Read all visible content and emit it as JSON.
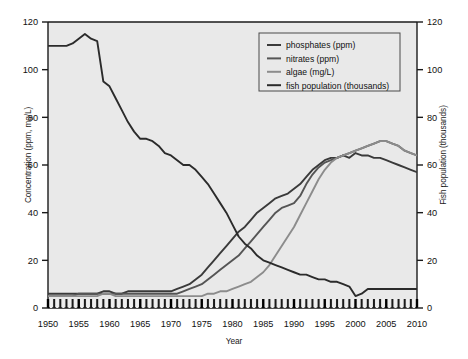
{
  "chart_data": {
    "type": "line",
    "title": "",
    "xlabel": "Year",
    "ylabel": "Concentration (ppm, mg/L)",
    "ylabel_right": "Fish population (thousands)",
    "xlim": [
      1950,
      2010
    ],
    "ylim": [
      0,
      120
    ],
    "ylim_right": [
      0,
      120
    ],
    "xticks": [
      1950,
      1955,
      1960,
      1965,
      1970,
      1975,
      1980,
      1985,
      1990,
      1995,
      2000,
      2005,
      2010
    ],
    "yticks": [
      0,
      20,
      40,
      60,
      80,
      100,
      120
    ],
    "yticks_right": [
      0,
      20,
      40,
      60,
      80,
      100,
      120
    ],
    "minor_tick_interval": 1,
    "grid": false,
    "legend_position": "top-right",
    "x": [
      1950,
      1951,
      1952,
      1953,
      1954,
      1955,
      1956,
      1957,
      1958,
      1959,
      1960,
      1961,
      1962,
      1963,
      1964,
      1965,
      1966,
      1967,
      1968,
      1969,
      1970,
      1971,
      1972,
      1973,
      1974,
      1975,
      1976,
      1977,
      1978,
      1979,
      1980,
      1981,
      1982,
      1983,
      1984,
      1985,
      1986,
      1987,
      1988,
      1989,
      1990,
      1991,
      1992,
      1993,
      1994,
      1995,
      1996,
      1997,
      1998,
      1999,
      2000,
      2001,
      2002,
      2003,
      2004,
      2005,
      2006,
      2007,
      2008,
      2009,
      2010
    ],
    "series": [
      {
        "name": "phosphates (ppm)",
        "unit": "ppm",
        "axis": "left",
        "color": "#3a3a3a",
        "values": [
          6,
          6,
          6,
          6,
          6,
          6,
          6,
          6,
          6,
          7,
          7,
          6,
          6,
          7,
          7,
          7,
          7,
          7,
          7,
          7,
          7,
          8,
          9,
          10,
          12,
          14,
          17,
          20,
          23,
          26,
          29,
          32,
          34,
          37,
          40,
          42,
          44,
          46,
          47,
          48,
          50,
          52,
          55,
          58,
          60,
          62,
          63,
          63,
          64,
          63,
          65,
          64,
          64,
          63,
          63,
          62,
          61,
          60,
          59,
          58,
          57
        ]
      },
      {
        "name": "nitrates (ppm)",
        "unit": "ppm",
        "axis": "left",
        "color": "#555555",
        "values": [
          5,
          5,
          5,
          5,
          5,
          6,
          6,
          6,
          6,
          6,
          6,
          6,
          6,
          6,
          6,
          6,
          6,
          6,
          6,
          6,
          6,
          6,
          7,
          8,
          9,
          10,
          12,
          14,
          16,
          18,
          20,
          22,
          25,
          28,
          31,
          34,
          37,
          40,
          42,
          43,
          44,
          47,
          52,
          56,
          59,
          61,
          62,
          63,
          64,
          65,
          66,
          67,
          68,
          69,
          70,
          70,
          69,
          68,
          66,
          65,
          64
        ]
      },
      {
        "name": "algae (mg/L)",
        "unit": "mg/L",
        "axis": "left",
        "color": "#8c8c8c",
        "values": [
          5,
          5,
          5,
          5,
          5,
          5,
          5,
          5,
          5,
          6,
          6,
          5,
          5,
          5,
          5,
          5,
          5,
          5,
          5,
          5,
          5,
          5,
          5,
          5,
          5,
          5,
          6,
          6,
          7,
          7,
          8,
          9,
          10,
          11,
          13,
          15,
          18,
          22,
          26,
          30,
          34,
          39,
          44,
          49,
          54,
          58,
          61,
          63,
          64,
          65,
          66,
          67,
          68,
          69,
          70,
          70,
          69,
          68,
          66,
          65,
          64
        ]
      },
      {
        "name": "fish population (thousands)",
        "unit": "thousands",
        "axis": "right",
        "color": "#2b2b2b",
        "values": [
          110,
          110,
          110,
          110,
          111,
          113,
          115,
          113,
          112,
          95,
          93,
          88,
          83,
          78,
          74,
          71,
          71,
          70,
          68,
          65,
          64,
          62,
          60,
          60,
          58,
          55,
          52,
          48,
          44,
          40,
          35,
          30,
          27,
          25,
          22,
          20,
          19,
          18,
          17,
          16,
          15,
          14,
          14,
          13,
          12,
          12,
          11,
          11,
          10,
          9,
          5,
          6,
          8,
          8,
          8,
          8,
          8,
          8,
          8,
          8,
          8
        ]
      }
    ],
    "legend": [
      {
        "label": "phosphates (ppm)",
        "color": "#3a3a3a"
      },
      {
        "label": "nitrates (ppm)",
        "color": "#555555"
      },
      {
        "label": "algae (mg/L)",
        "color": "#8c8c8c"
      },
      {
        "label": "fish population (thousands)",
        "color": "#2b2b2b"
      }
    ],
    "plot_background": "#e9e9e9",
    "axis_color": "#1a1a1a"
  }
}
